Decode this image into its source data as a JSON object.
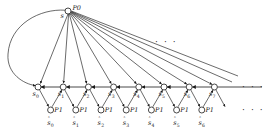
{
  "figure": {
    "type": "state-transition-diagram",
    "title": "",
    "colors": {
      "stroke": "#1a1a1a",
      "node_fill": "#ffffff",
      "text": "#1a1a1a",
      "background": "#ffffff"
    },
    "ellipsis_text": "· · ·"
  },
  "root": {
    "id": "p0",
    "process_label": "P0",
    "state_label": "s",
    "x": 68,
    "y": 11,
    "r": 3.0
  },
  "chain": {
    "label_prefix": "s",
    "row_y": 87,
    "start_x": 38,
    "spacing": 25.2,
    "radius": 3.0,
    "nodes": [
      {
        "label": "s",
        "index": "0",
        "x": 38
      },
      {
        "label": "s",
        "index": "1",
        "x": 63.2
      },
      {
        "label": "s",
        "index": "2",
        "x": 88.4
      },
      {
        "label": "s",
        "index": "3",
        "x": 113.6
      },
      {
        "label": "s",
        "index": "4",
        "x": 138.8
      },
      {
        "label": "s",
        "index": "5",
        "x": 164.0
      },
      {
        "label": "s",
        "index": "6",
        "x": 189.2
      },
      {
        "label": "s",
        "index": "7",
        "x": 214.4
      }
    ]
  },
  "aux": {
    "process_label": "P1",
    "label_prefix": "s",
    "row_y": 110,
    "radius": 3.0,
    "nodes": [
      {
        "label": "s",
        "index": "0",
        "x": 50.6
      },
      {
        "label": "s",
        "index": "1",
        "x": 75.8
      },
      {
        "label": "s",
        "index": "2",
        "x": 101.0
      },
      {
        "label": "s",
        "index": "3",
        "x": 126.2
      },
      {
        "label": "s",
        "index": "4",
        "x": 151.4
      },
      {
        "label": "s",
        "index": "5",
        "x": 176.6
      },
      {
        "label": "s",
        "index": "6",
        "x": 201.8
      }
    ]
  },
  "ellipses": [
    {
      "name": "fan-ellipsis",
      "text": "· · ·",
      "x": 155,
      "y": 38
    },
    {
      "name": "chain-ellipsis",
      "text": "· · ·",
      "x": 242,
      "y": 83
    },
    {
      "name": "aux-ellipsis",
      "text": "· · ·",
      "x": 242,
      "y": 106
    }
  ]
}
